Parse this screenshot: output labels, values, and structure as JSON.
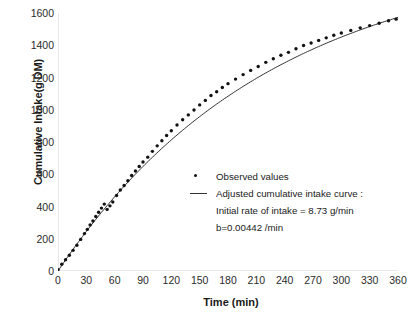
{
  "chart_data": {
    "type": "scatter",
    "title": "",
    "xlabel": "Time (min)",
    "ylabel": "Cumulative Intake(g DM)",
    "xlim": [
      0,
      360
    ],
    "ylim": [
      0,
      1600
    ],
    "xticks": [
      0,
      30,
      60,
      90,
      120,
      150,
      180,
      210,
      240,
      270,
      300,
      330,
      360
    ],
    "yticks": [
      0,
      200,
      400,
      600,
      800,
      1000,
      1200,
      1400,
      1600
    ],
    "grid": false,
    "legend_position": "inside-lower-right",
    "series": [
      {
        "name": "Observed values",
        "type": "scatter",
        "marker": "dot",
        "color": "#111111",
        "x": [
          0,
          4,
          8,
          12,
          16,
          20,
          24,
          28,
          31,
          34,
          37,
          40,
          43,
          46,
          49,
          52,
          55,
          58,
          62,
          66,
          70,
          74,
          78,
          82,
          86,
          90,
          95,
          100,
          105,
          110,
          115,
          120,
          126,
          132,
          138,
          144,
          150,
          156,
          162,
          168,
          174,
          180,
          188,
          196,
          204,
          212,
          220,
          228,
          236,
          244,
          252,
          260,
          268,
          276,
          284,
          292,
          300,
          310,
          320,
          330,
          340,
          350,
          358
        ],
        "y": [
          8,
          42,
          70,
          98,
          128,
          160,
          196,
          232,
          258,
          286,
          310,
          338,
          364,
          390,
          415,
          382,
          404,
          428,
          468,
          502,
          530,
          560,
          592,
          620,
          648,
          676,
          706,
          742,
          776,
          808,
          840,
          870,
          905,
          938,
          968,
          998,
          1030,
          1058,
          1088,
          1112,
          1138,
          1162,
          1190,
          1218,
          1244,
          1268,
          1294,
          1316,
          1338,
          1356,
          1378,
          1398,
          1414,
          1430,
          1446,
          1462,
          1476,
          1492,
          1508,
          1522,
          1536,
          1552,
          1562
        ]
      },
      {
        "name": "Adjusted cumulative intake curve :",
        "type": "line",
        "color": "#333333",
        "model": "I(t) = (a/b) * (1 - exp(-b*t))",
        "a": 8.73,
        "b": 0.00442
      }
    ]
  },
  "legend": {
    "entry_observed": "Observed values",
    "entry_curve": "Adjusted cumulative intake curve :",
    "note_initial_rate": "Initial rate of intake = 8.73 g/min",
    "note_b": "b=0.00442 /min"
  }
}
